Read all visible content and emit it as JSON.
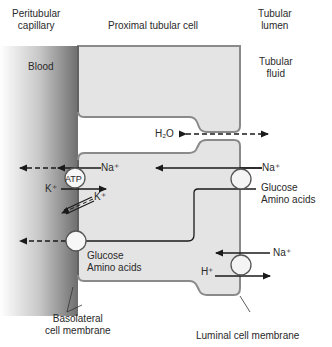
{
  "header": {
    "peritubular": [
      "Peritubular",
      "capillary"
    ],
    "cell": "Proximal tubular cell",
    "lumen": [
      "Tubular",
      "lumen"
    ]
  },
  "regions": {
    "blood": "Blood",
    "fluid": [
      "Tubular",
      "fluid"
    ]
  },
  "transport": {
    "h2o": "H₂O",
    "na_top": "Na⁺",
    "na_lumen": "Na⁺",
    "atp": "ATP",
    "k_in": "K⁺",
    "k_leak": "K⁺",
    "glucose_lumen": [
      "Glucose",
      "Amino acids"
    ],
    "glucose_baso": [
      "Glucose",
      "Amino acids"
    ],
    "na_exchanger": "Na⁺",
    "h_exchanger": "H⁺"
  },
  "footer": {
    "basolateral": [
      "Basolateral",
      "cell membrane"
    ],
    "luminal": "Luminal cell membrane"
  },
  "colors": {
    "cell_fill": "#e4e4e4",
    "cell_border": "#8a8a8a",
    "blood_dark": "#7a7a7a",
    "line": "#1a1a1a"
  }
}
